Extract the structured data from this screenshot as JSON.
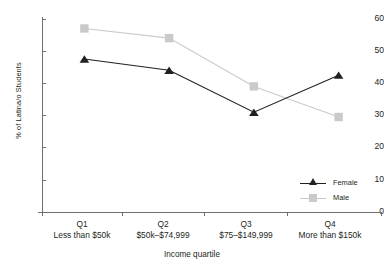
{
  "chart_data": {
    "type": "line",
    "title": "",
    "xlabel": "Income quartile",
    "ylabel": "% of Latina/o Students",
    "ylim": [
      0,
      60
    ],
    "yticks": [
      0,
      10,
      20,
      30,
      40,
      50,
      60
    ],
    "grid": false,
    "legend_position": "inside-lower-right",
    "categories": [
      "Q1",
      "Q2",
      "Q3",
      "Q4"
    ],
    "category_sublabels": [
      "Less than $50k",
      "$50k–$74,999",
      "$75–$149,999",
      "More than $150k"
    ],
    "series": [
      {
        "name": "Female",
        "color": "#231f20",
        "marker": "triangle",
        "values": [
          47.5,
          44,
          31,
          42.5
        ]
      },
      {
        "name": "Male",
        "color": "#c9cacb",
        "marker": "square",
        "values": [
          57,
          54,
          39,
          29.5
        ]
      }
    ]
  },
  "axis": {
    "y_title": "% of Latina/o Students",
    "x_title": "Income quartile",
    "y_labels": [
      "60",
      "50",
      "40",
      "30",
      "20",
      "10",
      "0"
    ]
  },
  "legend": {
    "items": [
      {
        "label": "Female"
      },
      {
        "label": "Male"
      }
    ]
  },
  "categories": [
    {
      "q": "Q1",
      "range": "Less than $50k"
    },
    {
      "q": "Q2",
      "range": "$50k–$74,999"
    },
    {
      "q": "Q3",
      "range": "$75–$149,999"
    },
    {
      "q": "Q4",
      "range": "More than $150k"
    }
  ]
}
